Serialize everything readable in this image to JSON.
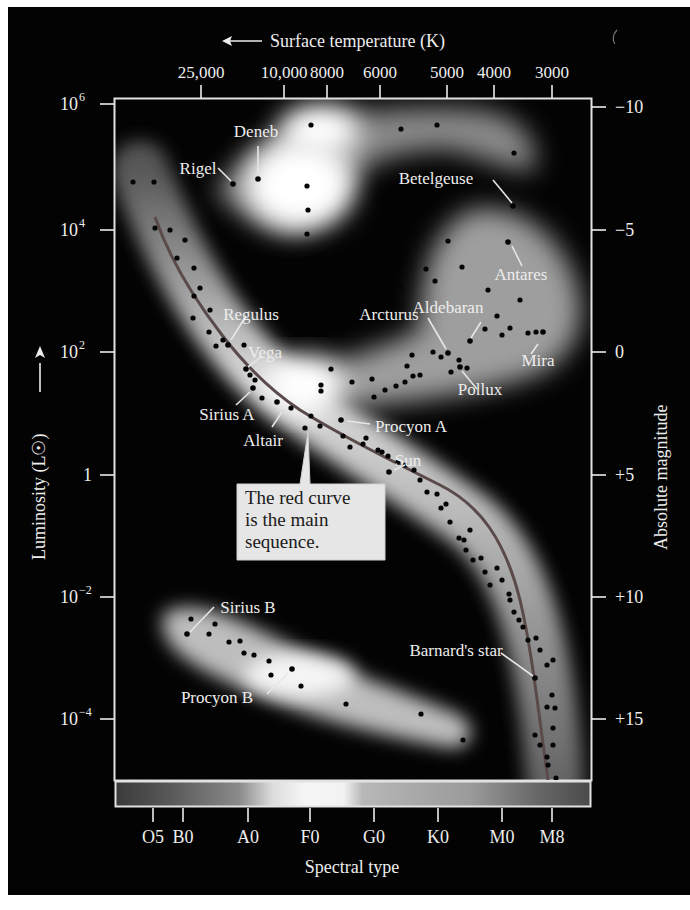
{
  "chart_data": {
    "type": "scatter",
    "top_axis": {
      "label": "Surface temperature (K)",
      "arrow": "left",
      "ticks": [
        {
          "label": "25,000",
          "x": 201
        },
        {
          "label": "10,000",
          "x": 284
        },
        {
          "label": "8000",
          "x": 327
        },
        {
          "label": "6000",
          "x": 380
        },
        {
          "label": "5000",
          "x": 447
        },
        {
          "label": "4000",
          "x": 494
        },
        {
          "label": "3000",
          "x": 552
        }
      ]
    },
    "left_axis": {
      "label": "Luminosity (L☉)",
      "scale": "log",
      "range": [
        1e-05,
        1000000
      ],
      "ticks": [
        {
          "label": "10",
          "exp": "6",
          "y": 104
        },
        {
          "label": "10",
          "exp": "4",
          "y": 230
        },
        {
          "label": "10",
          "exp": "2",
          "y": 352
        },
        {
          "label": "1",
          "exp": "",
          "y": 475
        },
        {
          "label": "10",
          "exp": "−2",
          "y": 597
        },
        {
          "label": "10",
          "exp": "−4",
          "y": 719
        }
      ]
    },
    "right_axis": {
      "label": "Absolute magnitude",
      "ticks": [
        {
          "label": "−10",
          "y": 107
        },
        {
          "label": "−5",
          "y": 230
        },
        {
          "label": "0",
          "y": 352
        },
        {
          "label": "+5",
          "y": 475
        },
        {
          "label": "+10",
          "y": 597
        },
        {
          "label": "+15",
          "y": 719
        }
      ]
    },
    "bottom_axis": {
      "label": "Spectral type",
      "ticks": [
        {
          "label": "O5",
          "x": 153
        },
        {
          "label": "B0",
          "x": 183
        },
        {
          "label": "A0",
          "x": 248
        },
        {
          "label": "F0",
          "x": 310
        },
        {
          "label": "G0",
          "x": 374
        },
        {
          "label": "K0",
          "x": 438
        },
        {
          "label": "M0",
          "x": 502
        },
        {
          "label": "M8",
          "x": 552
        }
      ]
    },
    "regions": [
      {
        "name": "supergiants"
      },
      {
        "name": "giants"
      },
      {
        "name": "main sequence"
      },
      {
        "name": "white dwarfs"
      }
    ],
    "labeled_stars": [
      {
        "name": "Deneb",
        "x": 258,
        "y": 179,
        "label_x": 256,
        "label_y": 137,
        "line": [
          258,
          146,
          258,
          174
        ]
      },
      {
        "name": "Rigel",
        "x": 233,
        "y": 184,
        "label_x": 198,
        "label_y": 174,
        "line": [
          218,
          168,
          231,
          181
        ]
      },
      {
        "name": "Betelgeuse",
        "x": 513,
        "y": 206,
        "label_x": 436,
        "label_y": 184,
        "line": [
          493,
          180,
          512,
          203
        ]
      },
      {
        "name": "Antares",
        "x": 508,
        "y": 242,
        "label_x": 521,
        "label_y": 280,
        "line": [
          512,
          246,
          522,
          266
        ]
      },
      {
        "name": "Regulus",
        "x": 228,
        "y": 345,
        "label_x": 251,
        "label_y": 320,
        "line": [
          246,
          316,
          231,
          340
        ]
      },
      {
        "name": "Vega",
        "x": 246,
        "y": 369,
        "label_x": 265,
        "label_y": 358,
        "line": [
          262,
          356,
          248,
          367
        ]
      },
      {
        "name": "Arcturus",
        "x": 448,
        "y": 353,
        "label_x": 389,
        "label_y": 320,
        "line": [
          428,
          318,
          446,
          349
        ]
      },
      {
        "name": "Aldebaran",
        "x": 470,
        "y": 341,
        "label_x": 448,
        "label_y": 313,
        "line": [
          481,
          322,
          471,
          338
        ]
      },
      {
        "name": "Mira",
        "x": 543,
        "y": 332,
        "label_x": 538,
        "label_y": 366,
        "line": [
          538,
          344,
          531,
          354
        ]
      },
      {
        "name": "Pollux",
        "x": 460,
        "y": 367,
        "label_x": 480,
        "label_y": 395,
        "line": [
          477,
          389,
          462,
          371
        ]
      },
      {
        "name": "Sirius A",
        "x": 253,
        "y": 388,
        "label_x": 227,
        "label_y": 420,
        "line": [
          236,
          405,
          250,
          392
        ]
      },
      {
        "name": "Altair",
        "x": 277,
        "y": 402,
        "label_x": 263,
        "label_y": 446,
        "line": [
          272,
          427,
          282,
          412
        ]
      },
      {
        "name": "Procyon A",
        "x": 341,
        "y": 420,
        "label_x": 411,
        "label_y": 432,
        "line": [
          347,
          421,
          370,
          424
        ]
      },
      {
        "name": "Sun",
        "x": 389,
        "y": 472,
        "label_x": 408,
        "label_y": 466,
        "line": [
          394,
          470,
          405,
          465
        ]
      },
      {
        "name": "Sirius B",
        "x": 187,
        "y": 634,
        "label_x": 248,
        "label_y": 613,
        "line": [
          214,
          607,
          190,
          632
        ]
      },
      {
        "name": "Procyon B",
        "x": 292,
        "y": 669,
        "label_x": 217,
        "label_y": 703,
        "line": [
          267,
          694,
          288,
          673
        ]
      },
      {
        "name": "Barnard's star",
        "x": 535,
        "y": 678,
        "label_x": 456,
        "label_y": 656,
        "line": [
          501,
          653,
          533,
          676
        ]
      }
    ],
    "annotation": "The red curve is the main sequence.",
    "main_sequence_curve_color": "#5a4a4a"
  },
  "colors": {
    "background": "#030303",
    "frame": "#e2e2e2",
    "text": "#ededed",
    "callout_bg": "#e6e6e6",
    "callout_text": "#1a1a1a"
  }
}
